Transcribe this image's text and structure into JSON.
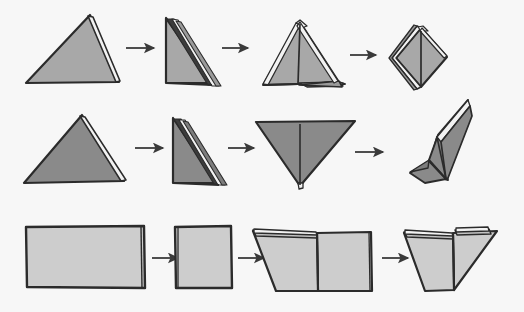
{
  "canvas": {
    "width": 524,
    "height": 312,
    "background": "#f7f7f7"
  },
  "palette": {
    "background": "#f7f7f7",
    "row1_fill": "#a8a8a8",
    "row1_shade": "#9a9a9a",
    "row2_fill": "#8a8a8a",
    "row2_shade": "#7d7d7d",
    "row3_fill": "#cdcdcd",
    "row3_shade": "#c2c2c2",
    "paper_white": "#f2f2f2",
    "outline": "#2b2b2b",
    "fold_line": "#3a3a3a",
    "arrow": "#3a3a3a"
  },
  "rows": [
    {
      "name": "row-1-triangle-sequence",
      "label": "Row 1",
      "fill": "#a8a8a8",
      "steps": [
        {
          "index": 1,
          "name": "large-triangle",
          "label": "Large flat triangle"
        },
        {
          "index": 2,
          "name": "folded-right-triangle",
          "label": "Folded right triangle with layered edge"
        },
        {
          "index": 3,
          "name": "opened-kite-form",
          "label": "Partially opened kite form"
        },
        {
          "index": 4,
          "name": "diamond-form",
          "label": "Closed diamond form"
        }
      ],
      "arrows": [
        {
          "name": "arrow-1-1",
          "x": 126,
          "y": 48,
          "length": 28
        },
        {
          "name": "arrow-1-2",
          "x": 222,
          "y": 48,
          "length": 26
        },
        {
          "name": "arrow-1-3",
          "x": 350,
          "y": 55,
          "length": 26
        }
      ]
    },
    {
      "name": "row-2-triangle-sequence",
      "label": "Row 2",
      "fill": "#8a8a8a",
      "steps": [
        {
          "index": 1,
          "name": "large-triangle",
          "label": "Large flat triangle"
        },
        {
          "index": 2,
          "name": "folded-right-triangle",
          "label": "Folded right triangle with layered edge"
        },
        {
          "index": 3,
          "name": "inverted-triangle",
          "label": "Inverted triangle with center crease"
        },
        {
          "index": 4,
          "name": "standing-fold-form",
          "label": "Standing three-dimensional fold"
        }
      ],
      "arrows": [
        {
          "name": "arrow-2-1",
          "x": 135,
          "y": 148,
          "length": 28
        },
        {
          "name": "arrow-2-2",
          "x": 228,
          "y": 148,
          "length": 26
        },
        {
          "name": "arrow-2-3",
          "x": 355,
          "y": 152,
          "length": 28
        }
      ]
    },
    {
      "name": "row-3-rectangle-sequence",
      "label": "Row 3",
      "fill": "#cdcdcd",
      "steps": [
        {
          "index": 1,
          "name": "wide-rectangle",
          "label": "Wide flat rectangle"
        },
        {
          "index": 2,
          "name": "folded-square",
          "label": "Folded square"
        },
        {
          "index": 3,
          "name": "corner-folded-square",
          "label": "Square with left corner folded diagonally"
        },
        {
          "index": 4,
          "name": "double-corner-folded-triangle",
          "label": "Both corners folded into triangle"
        }
      ],
      "arrows": [
        {
          "name": "arrow-3-1",
          "x": 152,
          "y": 258,
          "length": 26
        },
        {
          "name": "arrow-3-2",
          "x": 238,
          "y": 258,
          "length": 26
        },
        {
          "name": "arrow-3-3",
          "x": 382,
          "y": 258,
          "length": 26
        }
      ]
    }
  ]
}
